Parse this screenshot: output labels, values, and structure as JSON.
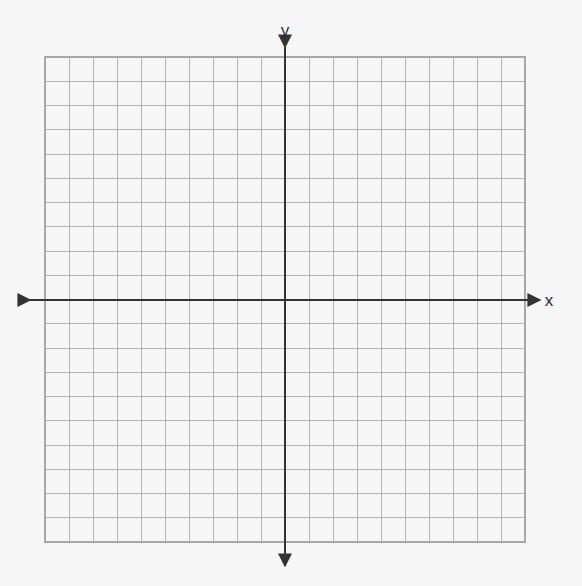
{
  "figure": {
    "title": "",
    "background_color": "#f7f7f7",
    "width": 582,
    "height": 586
  },
  "axes": {
    "x_label": "x",
    "y_label": "y",
    "axis_color": "#333333",
    "axis_stroke_width": 2,
    "arrowheads": [
      "left",
      "right",
      "up",
      "down"
    ],
    "origin_px": {
      "x": 285,
      "y": 300
    }
  },
  "grid": {
    "line_color": "#b4b4b4",
    "line_width": 1,
    "border_color": "#a8a8a8",
    "columns": 20,
    "rows": 20,
    "cell_width_px": 24,
    "cell_height_px": 24.25,
    "left_px": 45,
    "top_px": 57,
    "right_px": 525,
    "bottom_px": 542
  },
  "chart_data": {
    "type": "scatter",
    "title": "",
    "xlabel": "x",
    "ylabel": "y",
    "grid": true,
    "legend": null,
    "legend_position": "none",
    "xlim": [
      -10,
      10
    ],
    "ylim": [
      -10,
      10
    ],
    "xticks": [
      -10,
      -9,
      -8,
      -7,
      -6,
      -5,
      -4,
      -3,
      -2,
      -1,
      0,
      1,
      2,
      3,
      4,
      5,
      6,
      7,
      8,
      9,
      10
    ],
    "yticks": [
      -10,
      -9,
      -8,
      -7,
      -6,
      -5,
      -4,
      -3,
      -2,
      -1,
      0,
      1,
      2,
      3,
      4,
      5,
      6,
      7,
      8,
      9,
      10
    ],
    "xtick_labels": [],
    "ytick_labels": [],
    "series": [],
    "x": [],
    "values": [],
    "annotations": []
  }
}
